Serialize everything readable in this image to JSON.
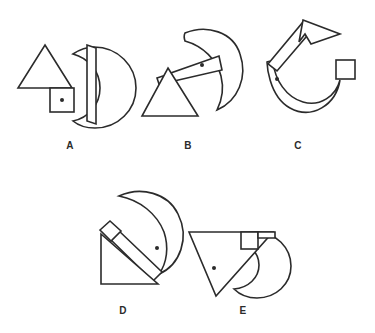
{
  "page": {
    "background_color": "#ffffff",
    "ink_color": "#2b2b2b",
    "width": 375,
    "height": 333
  },
  "options": [
    {
      "id": "A",
      "label": "A",
      "parts": [
        "triangle",
        "square",
        "crescent"
      ],
      "dot_marker": true,
      "orientation": "crescent opening left, triangle upper-left, square lower-middle"
    },
    {
      "id": "B",
      "label": "B",
      "parts": [
        "triangle",
        "square",
        "crescent"
      ],
      "dot_marker": true,
      "orientation": "crescent upper-right, bar angled down-left to triangle"
    },
    {
      "id": "C",
      "label": "C",
      "parts": [
        "triangle",
        "square",
        "crescent"
      ],
      "dot_marker": true,
      "orientation": "crescent opening upward, bar angled up-right to triangle, square at right"
    },
    {
      "id": "D",
      "label": "D",
      "parts": [
        "triangle",
        "square",
        "crescent"
      ],
      "dot_marker": true,
      "orientation": "crescent upper-right, bar down-left from crescent to square, triangle lower-left"
    },
    {
      "id": "E",
      "label": "E",
      "parts": [
        "triangle",
        "square",
        "crescent"
      ],
      "dot_marker": true,
      "orientation": "inverted triangle at left, square upper-right, crescent behind right"
    }
  ],
  "colors": {
    "ink": "#2b2b2b",
    "background": "#ffffff"
  }
}
